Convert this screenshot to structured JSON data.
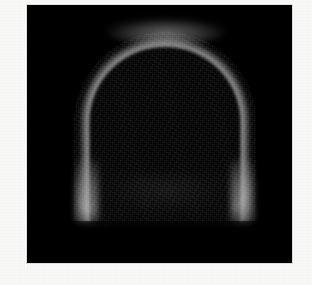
{
  "page": {
    "background_color": "#f8f8f6",
    "width": 312,
    "height": 285
  },
  "image_panel": {
    "label": "scan-image-panel",
    "background_color": "#000000",
    "left": 27,
    "top": 5,
    "width": 265,
    "height": 258,
    "border_color": "#dedede"
  },
  "scan": {
    "modality_appearance": "grayscale",
    "structure_name": "dome-shaped bright rim",
    "description": "A dome / arch shaped bright rim with a dark interior cavity on a black background",
    "colors": {
      "background": "#000000",
      "rim_bright": "#cdcdcd",
      "rim_mid": "#8a8a8a",
      "interior": "#050505",
      "page_margin": "#f8f8f6"
    },
    "geometry": {
      "apex_x": 160,
      "apex_y": 42,
      "left_rim_x": 82,
      "right_rim_x": 258,
      "base_y": 218,
      "dome_width": 176,
      "dome_height": 176
    },
    "hotspots": [
      {
        "name": "apex-arc",
        "x": 160,
        "y": 46,
        "intensity": "high"
      },
      {
        "name": "lower-left-rim",
        "x": 88,
        "y": 200,
        "intensity": "high"
      },
      {
        "name": "lower-right-rim",
        "x": 255,
        "y": 200,
        "intensity": "high"
      }
    ],
    "texture": "fine pixel grain / acquisition noise"
  }
}
